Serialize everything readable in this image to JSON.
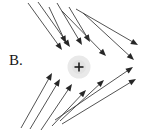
{
  "figure": {
    "label": "B.",
    "width": 156,
    "height": 131,
    "background_color": "#ffffff",
    "line_color": "#3f3f3f",
    "arrowhead_color": "#262626",
    "charge": {
      "symbol": "+",
      "sign": "positive",
      "center_x": 79,
      "center_y": 67,
      "radius": 11,
      "glow_color": "#e9e9e9",
      "symbol_color": "#1d1d1d"
    },
    "vectors": [
      {
        "name": "vector-upper-left-1",
        "x1": 28,
        "y1": 3,
        "x2": 62,
        "y2": 50
      },
      {
        "name": "vector-upper-left-2",
        "x1": 38,
        "y1": 2,
        "x2": 70,
        "y2": 47
      },
      {
        "name": "vector-upper-left-3",
        "x1": 49,
        "y1": 7,
        "x2": 66,
        "y2": 43
      },
      {
        "name": "vector-upper-mid-1",
        "x1": 57,
        "y1": 3,
        "x2": 82,
        "y2": 45
      },
      {
        "name": "vector-upper-mid-2",
        "x1": 69,
        "y1": 7,
        "x2": 90,
        "y2": 42
      },
      {
        "name": "vector-upper-right-1",
        "x1": 62,
        "y1": 11,
        "x2": 106,
        "y2": 56
      },
      {
        "name": "vector-upper-right-2",
        "x1": 76,
        "y1": 9,
        "x2": 138,
        "y2": 45
      },
      {
        "name": "vector-upper-right-3",
        "x1": 83,
        "y1": 13,
        "x2": 134,
        "y2": 60
      },
      {
        "name": "vector-lower-left-1",
        "x1": 21,
        "y1": 128,
        "x2": 52,
        "y2": 73
      },
      {
        "name": "vector-lower-left-2",
        "x1": 30,
        "y1": 129,
        "x2": 60,
        "y2": 79
      },
      {
        "name": "vector-lower-left-3",
        "x1": 41,
        "y1": 130,
        "x2": 72,
        "y2": 84
      },
      {
        "name": "vector-lower-mid-1",
        "x1": 52,
        "y1": 126,
        "x2": 86,
        "y2": 90
      },
      {
        "name": "vector-lower-mid-2",
        "x1": 60,
        "y1": 121,
        "x2": 104,
        "y2": 80
      },
      {
        "name": "vector-lower-right-1",
        "x1": 55,
        "y1": 120,
        "x2": 133,
        "y2": 67
      },
      {
        "name": "vector-lower-right-2",
        "x1": 62,
        "y1": 124,
        "x2": 136,
        "y2": 79
      }
    ]
  }
}
